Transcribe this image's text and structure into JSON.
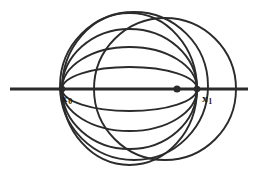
{
  "figure": {
    "type": "geometric-diagram",
    "background_color": "#ffffff",
    "stroke_color": "#2b2b2b",
    "labels": {
      "left_point": {
        "base": "x",
        "subscript": "0",
        "text": "x0"
      },
      "right_point": {
        "base": "x",
        "subscript": "1",
        "text": "x1"
      }
    },
    "points": {
      "x0": {
        "x": 62,
        "y": 89
      },
      "x1": {
        "x": 197,
        "y": 89
      },
      "marker_dot": {
        "x": 177,
        "y": 89,
        "radius": 3.6,
        "filled": true
      }
    },
    "axis_line": {
      "x_start": 10,
      "x_end": 248,
      "y": 89,
      "width": 3.2
    },
    "pencil_circles": [
      {
        "cx": 129.5,
        "cy": 89,
        "rx": 67.5,
        "ry": 76,
        "stroke": 1.9
      },
      {
        "cx": 129.5,
        "cy": 89,
        "rx": 67.5,
        "ry": 60,
        "stroke": 1.9
      },
      {
        "cx": 129.5,
        "cy": 89,
        "rx": 67.5,
        "ry": 42,
        "stroke": 1.9
      },
      {
        "cx": 129.5,
        "cy": 89,
        "rx": 67.5,
        "ry": 22,
        "stroke": 1.9
      }
    ],
    "large_circles": [
      {
        "cx": 165,
        "cy": 89,
        "r": 71,
        "stroke": 1.9,
        "name": "right-large-circle"
      },
      {
        "cx": 134,
        "cy": 86,
        "r": 74,
        "stroke": 1.9,
        "name": "center-large-circle"
      }
    ]
  }
}
